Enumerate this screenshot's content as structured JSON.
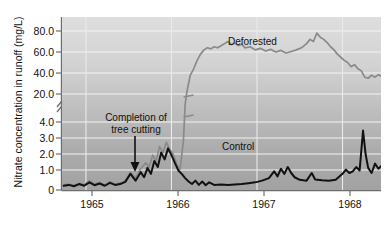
{
  "chart_data": {
    "type": "line",
    "title": "",
    "xlabel": "",
    "ylabel": "Nitrate concentration in runoff (mg/L)",
    "grid": true,
    "legend_position": "inline-annotation",
    "axis_break": {
      "present": true,
      "between": [
        4.0,
        20.0
      ],
      "note": "y-axis broken between 4.0 and 20.0"
    },
    "xlim": [
      1964.72,
      1968.45
    ],
    "x_ticks": [
      1965,
      1966,
      1967,
      1968
    ],
    "x_tick_labels": [
      "1965",
      "1966",
      "1967",
      "1968"
    ],
    "y_ticks_lower": [
      0,
      1.0,
      2.0,
      3.0,
      4.0
    ],
    "y_tick_labels_lower": [
      "0",
      "1.0",
      "2.0",
      "3.0",
      "4.0"
    ],
    "y_ticks_upper": [
      20.0,
      40.0,
      60.0,
      80.0
    ],
    "y_tick_labels_upper": [
      "20.0",
      "40.0",
      "60.0",
      "80.0"
    ],
    "series": [
      {
        "name": "Deforested",
        "color": "#8a8a8a",
        "points": [
          [
            1964.74,
            0.3
          ],
          [
            1964.8,
            0.35
          ],
          [
            1964.86,
            0.28
          ],
          [
            1964.92,
            0.4
          ],
          [
            1964.98,
            0.3
          ],
          [
            1965.04,
            0.55
          ],
          [
            1965.1,
            0.35
          ],
          [
            1965.16,
            0.45
          ],
          [
            1965.22,
            0.3
          ],
          [
            1965.28,
            0.5
          ],
          [
            1965.34,
            0.35
          ],
          [
            1965.4,
            0.4
          ],
          [
            1965.46,
            0.55
          ],
          [
            1965.52,
            1.05
          ],
          [
            1965.58,
            0.7
          ],
          [
            1965.64,
            1.25
          ],
          [
            1965.7,
            1.6
          ],
          [
            1965.74,
            1.35
          ],
          [
            1965.78,
            2.05
          ],
          [
            1965.82,
            1.7
          ],
          [
            1965.86,
            2.55
          ],
          [
            1965.9,
            2.2
          ],
          [
            1965.94,
            2.8
          ],
          [
            1965.98,
            2.4
          ],
          [
            1966.02,
            2.1
          ],
          [
            1966.06,
            1.55
          ],
          [
            1966.1,
            1.2
          ],
          [
            1966.14,
            2.9
          ],
          [
            1966.16,
            14.0
          ],
          [
            1966.18,
            22.0
          ],
          [
            1966.2,
            30.0
          ],
          [
            1966.22,
            38.0
          ],
          [
            1966.26,
            44.0
          ],
          [
            1966.3,
            52.0
          ],
          [
            1966.34,
            58.0
          ],
          [
            1966.38,
            62.0
          ],
          [
            1966.42,
            64.0
          ],
          [
            1966.46,
            63.0
          ],
          [
            1966.5,
            65.0
          ],
          [
            1966.54,
            64.0
          ],
          [
            1966.58,
            66.0
          ],
          [
            1966.62,
            68.0
          ],
          [
            1966.66,
            70.0
          ],
          [
            1966.7,
            67.0
          ],
          [
            1966.74,
            68.5
          ],
          [
            1966.78,
            66.0
          ],
          [
            1966.82,
            67.5
          ],
          [
            1966.86,
            64.0
          ],
          [
            1966.92,
            65.0
          ],
          [
            1966.98,
            62.0
          ],
          [
            1967.04,
            63.5
          ],
          [
            1967.1,
            61.0
          ],
          [
            1967.16,
            62.5
          ],
          [
            1967.22,
            60.0
          ],
          [
            1967.28,
            61.5
          ],
          [
            1967.34,
            59.0
          ],
          [
            1967.4,
            60.5
          ],
          [
            1967.46,
            62.0
          ],
          [
            1967.52,
            64.0
          ],
          [
            1967.58,
            68.0
          ],
          [
            1967.62,
            72.0
          ],
          [
            1967.66,
            70.0
          ],
          [
            1967.7,
            78.0
          ],
          [
            1967.74,
            74.0
          ],
          [
            1967.78,
            72.0
          ],
          [
            1967.82,
            69.0
          ],
          [
            1967.86,
            65.0
          ],
          [
            1967.9,
            62.0
          ],
          [
            1967.94,
            58.0
          ],
          [
            1967.98,
            55.0
          ],
          [
            1968.02,
            52.0
          ],
          [
            1968.06,
            50.0
          ],
          [
            1968.1,
            46.0
          ],
          [
            1968.14,
            48.0
          ],
          [
            1968.18,
            44.0
          ],
          [
            1968.22,
            42.0
          ],
          [
            1968.26,
            36.0
          ],
          [
            1968.3,
            35.0
          ],
          [
            1968.34,
            38.0
          ],
          [
            1968.38,
            36.0
          ],
          [
            1968.42,
            38.5
          ],
          [
            1968.45,
            37.0
          ]
        ]
      },
      {
        "name": "Control",
        "color": "#111111",
        "points": [
          [
            1964.74,
            0.25
          ],
          [
            1964.8,
            0.3
          ],
          [
            1964.86,
            0.22
          ],
          [
            1964.92,
            0.35
          ],
          [
            1964.98,
            0.25
          ],
          [
            1965.04,
            0.45
          ],
          [
            1965.1,
            0.28
          ],
          [
            1965.16,
            0.38
          ],
          [
            1965.22,
            0.25
          ],
          [
            1965.28,
            0.42
          ],
          [
            1965.34,
            0.3
          ],
          [
            1965.4,
            0.35
          ],
          [
            1965.46,
            0.48
          ],
          [
            1965.52,
            0.95
          ],
          [
            1965.58,
            0.55
          ],
          [
            1965.64,
            1.05
          ],
          [
            1965.68,
            0.75
          ],
          [
            1965.72,
            1.3
          ],
          [
            1965.76,
            0.95
          ],
          [
            1965.8,
            1.7
          ],
          [
            1965.84,
            1.35
          ],
          [
            1965.88,
            2.2
          ],
          [
            1965.92,
            1.8
          ],
          [
            1965.96,
            2.45
          ],
          [
            1966.0,
            2.05
          ],
          [
            1966.04,
            1.6
          ],
          [
            1966.08,
            1.15
          ],
          [
            1966.12,
            0.95
          ],
          [
            1966.16,
            0.7
          ],
          [
            1966.2,
            0.5
          ],
          [
            1966.24,
            0.35
          ],
          [
            1966.28,
            0.55
          ],
          [
            1966.32,
            0.3
          ],
          [
            1966.36,
            0.5
          ],
          [
            1966.4,
            0.28
          ],
          [
            1966.44,
            0.45
          ],
          [
            1966.5,
            0.3
          ],
          [
            1966.58,
            0.32
          ],
          [
            1966.66,
            0.3
          ],
          [
            1966.74,
            0.33
          ],
          [
            1966.82,
            0.35
          ],
          [
            1966.9,
            0.4
          ],
          [
            1966.98,
            0.45
          ],
          [
            1967.06,
            0.55
          ],
          [
            1967.14,
            0.7
          ],
          [
            1967.2,
            1.1
          ],
          [
            1967.24,
            0.8
          ],
          [
            1967.28,
            1.25
          ],
          [
            1967.32,
            0.95
          ],
          [
            1967.36,
            1.35
          ],
          [
            1967.4,
            1.0
          ],
          [
            1967.44,
            0.75
          ],
          [
            1967.5,
            0.6
          ],
          [
            1967.58,
            0.55
          ],
          [
            1967.64,
            1.0
          ],
          [
            1967.68,
            0.62
          ],
          [
            1967.76,
            0.58
          ],
          [
            1967.84,
            0.55
          ],
          [
            1967.92,
            0.6
          ],
          [
            1968.0,
            0.95
          ],
          [
            1968.04,
            1.2
          ],
          [
            1968.08,
            1.0
          ],
          [
            1968.12,
            1.1
          ],
          [
            1968.16,
            1.35
          ],
          [
            1968.2,
            1.15
          ],
          [
            1968.24,
            3.5
          ],
          [
            1968.27,
            2.1
          ],
          [
            1968.3,
            1.3
          ],
          [
            1968.34,
            1.0
          ],
          [
            1968.38,
            1.55
          ],
          [
            1968.42,
            1.25
          ],
          [
            1968.45,
            1.4
          ]
        ]
      }
    ],
    "annotations": [
      {
        "name": "completion-of-tree-cutting",
        "line1": "Completion of",
        "line2": "tree cutting",
        "arrow": "down",
        "x": 1965.72
      },
      {
        "name": "deforested-label",
        "text": "Deforested"
      },
      {
        "name": "control-label",
        "text": "Control"
      }
    ]
  },
  "axes": {
    "y_title": "Nitrate concentration in runoff (mg/L)",
    "y_labels": [
      "80.0",
      "60.0",
      "40.0",
      "20.0",
      "4.0",
      "3.0",
      "2.0",
      "1.0",
      "0"
    ],
    "x_labels": [
      "1965",
      "1966",
      "1967",
      "1968"
    ]
  },
  "annotations": {
    "cut_line1": "Completion of",
    "cut_line2": "tree cutting",
    "deforested": "Deforested",
    "control": "Control"
  },
  "colors": {
    "deforested_line": "#8a8a8a",
    "control_line": "#111111",
    "plot_background_top": "#d9d9d9",
    "plot_background_bottom": "#a8a8a8",
    "gridline": "#f2f2f2",
    "axis": "#6e6e6e",
    "text": "#111111"
  }
}
